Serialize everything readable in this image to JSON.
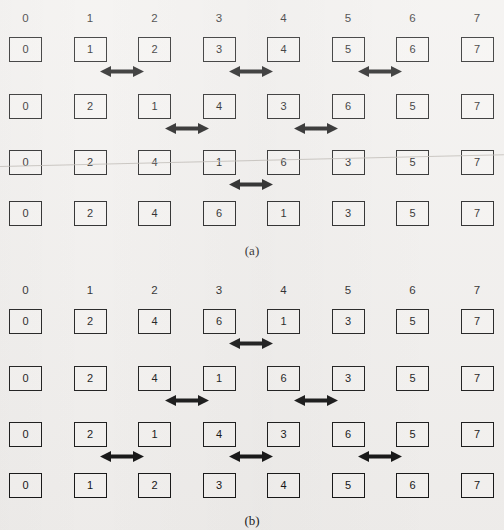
{
  "figure": {
    "background_color": "#f2f0ee",
    "box_border_color": "#151515",
    "arrow_color": "#111111",
    "column_headers": [
      "0",
      "1",
      "2",
      "3",
      "4",
      "5",
      "6",
      "7"
    ],
    "panels": [
      {
        "caption": "(a)",
        "rows": [
          {
            "values": [
              "0",
              "1",
              "2",
              "3",
              "4",
              "5",
              "6",
              "7"
            ],
            "arrows": [
              {
                "between": [
                  1,
                  2
                ],
                "type": "double-headed-arrow"
              },
              {
                "between": [
                  3,
                  4
                ],
                "type": "double-headed-arrow"
              },
              {
                "between": [
                  5,
                  6
                ],
                "type": "double-headed-arrow"
              }
            ]
          },
          {
            "values": [
              "0",
              "2",
              "1",
              "4",
              "3",
              "6",
              "5",
              "7"
            ],
            "arrows": [
              {
                "between": [
                  2,
                  3
                ],
                "type": "double-headed-arrow"
              },
              {
                "between": [
                  4,
                  5
                ],
                "type": "double-headed-arrow"
              }
            ]
          },
          {
            "values": [
              "0",
              "2",
              "4",
              "1",
              "6",
              "3",
              "5",
              "7"
            ],
            "arrows": [
              {
                "between": [
                  3,
                  4
                ],
                "type": "double-headed-arrow"
              }
            ]
          },
          {
            "values": [
              "0",
              "2",
              "4",
              "6",
              "1",
              "3",
              "5",
              "7"
            ],
            "arrows": []
          }
        ]
      },
      {
        "caption": "(b)",
        "rows": [
          {
            "values": [
              "0",
              "2",
              "4",
              "6",
              "1",
              "3",
              "5",
              "7"
            ],
            "arrows": [
              {
                "between": [
                  3,
                  4
                ],
                "type": "double-headed-arrow"
              }
            ]
          },
          {
            "values": [
              "0",
              "2",
              "4",
              "1",
              "6",
              "3",
              "5",
              "7"
            ],
            "arrows": [
              {
                "between": [
                  2,
                  3
                ],
                "type": "double-headed-arrow"
              },
              {
                "between": [
                  4,
                  5
                ],
                "type": "double-headed-arrow"
              }
            ]
          },
          {
            "values": [
              "0",
              "2",
              "1",
              "4",
              "3",
              "6",
              "5",
              "7"
            ],
            "arrows": [
              {
                "between": [
                  1,
                  2
                ],
                "type": "double-headed-arrow"
              },
              {
                "between": [
                  3,
                  4
                ],
                "type": "double-headed-arrow"
              },
              {
                "between": [
                  5,
                  6
                ],
                "type": "double-headed-arrow"
              }
            ]
          },
          {
            "values": [
              "0",
              "1",
              "2",
              "3",
              "4",
              "5",
              "6",
              "7"
            ],
            "arrows": []
          }
        ]
      }
    ]
  }
}
